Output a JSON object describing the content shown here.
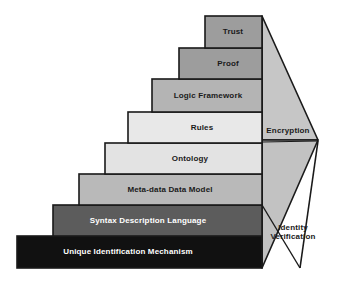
{
  "diagram": {
    "type": "layered-staircase",
    "background_color": "#ffffff",
    "outline_color": "#1a1a1a",
    "steps": [
      {
        "id": "trust",
        "label": "Trust",
        "level": 8,
        "fill": "#9d9d9d",
        "text_color": "#1a1a1a"
      },
      {
        "id": "proof",
        "label": "Proof",
        "level": 7,
        "fill": "#9d9d9d",
        "text_color": "#1a1a1a"
      },
      {
        "id": "logic-framework",
        "label": "Logic Framework",
        "level": 6,
        "fill": "#b4b4b4",
        "text_color": "#1a1a1a"
      },
      {
        "id": "rules",
        "label": "Rules",
        "level": 5,
        "fill": "#e8e8e8",
        "text_color": "#1a1a1a"
      },
      {
        "id": "ontology",
        "label": "Ontology",
        "level": 4,
        "fill": "#e3e3e3",
        "text_color": "#1a1a1a"
      },
      {
        "id": "meta-data-data-model",
        "label": "Meta-data Data Model",
        "level": 3,
        "fill": "#b9b9b9",
        "text_color": "#1a1a1a"
      },
      {
        "id": "syntax-description-language",
        "label": "Syntax Description Language",
        "level": 2,
        "fill": "#5c5c5c",
        "text_color": "#ffffff"
      },
      {
        "id": "unique-identification-mechanism",
        "label": "Unique Identification Mechanism",
        "level": 1,
        "fill": "#111111",
        "text_color": "#ffffff"
      }
    ],
    "side_panels": [
      {
        "id": "encryption",
        "label": "Encryption",
        "fill": "#c6c6c6",
        "text_color": "#1a1a1a"
      },
      {
        "id": "identity-verification",
        "label_line_1": "Identity",
        "label_line_2": "Verification",
        "fill": "#c2c2c2",
        "text_color": "#1a1a1a"
      }
    ]
  }
}
